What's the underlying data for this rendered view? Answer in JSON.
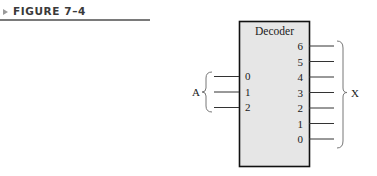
{
  "figure": {
    "label": "FIGURE 7–4",
    "arrow_color": "#9a9a9a"
  },
  "diagram": {
    "block_title": "Decoder",
    "block_fill": "#e6e6e6",
    "input_group_label": "A",
    "output_group_label": "X",
    "inputs": [
      "0",
      "1",
      "2"
    ],
    "outputs": [
      "6",
      "5",
      "4",
      "3",
      "2",
      "1",
      "0"
    ]
  }
}
